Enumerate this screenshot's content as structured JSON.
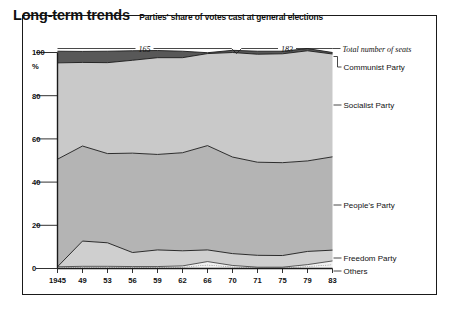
{
  "header": {
    "title": "Long-term trends",
    "subtitle": "Parties' share of votes cast at general elections"
  },
  "colors": {
    "communist": "#585858",
    "socialist": "#c9c9c9",
    "peoples": "#b4b4b4",
    "freedom": "#cfcfcf",
    "others": "#f2f2f2",
    "line": "#1a1a1a",
    "frame": "#1a1a1a"
  },
  "annotations": {
    "seats_left": "165",
    "seats_right": "183",
    "seats_caption": "Total number of seats"
  },
  "legend": {
    "items": [
      {
        "name": "communist",
        "label": "Communist Party"
      },
      {
        "name": "socialist",
        "label": "Socialist Party"
      },
      {
        "name": "peoples",
        "label": "People's Party"
      },
      {
        "name": "freedom",
        "label": "Freedom Party"
      },
      {
        "name": "others",
        "label": "Others"
      }
    ]
  },
  "chart_data": {
    "type": "area",
    "title": "Long-term trends",
    "subtitle": "Parties' share of votes cast at general elections",
    "xlabel": "",
    "ylabel": "%",
    "ylim": [
      0,
      100
    ],
    "yticks": [
      0,
      20,
      40,
      60,
      80,
      100
    ],
    "grid": false,
    "stacked": true,
    "legend_position": "right",
    "x": [
      1945,
      1949,
      1953,
      1956,
      1959,
      1962,
      1966,
      1970,
      1971,
      1975,
      1979,
      1983
    ],
    "categories": [
      "1945",
      "49",
      "53",
      "56",
      "59",
      "62",
      "66",
      "70",
      "71",
      "75",
      "79",
      "83"
    ],
    "series": [
      {
        "name": "Others",
        "values": [
          0.8,
          1.0,
          1.0,
          0.9,
          0.9,
          1.2,
          3.2,
          1.4,
          0.6,
          0.6,
          1.8,
          3.5
        ]
      },
      {
        "name": "Freedom Party",
        "values": [
          0.0,
          11.7,
          10.9,
          6.5,
          7.7,
          7.0,
          5.4,
          5.5,
          5.5,
          5.4,
          6.1,
          5.0
        ]
      },
      {
        "name": "People's Party",
        "values": [
          49.8,
          44.0,
          41.3,
          46.0,
          44.2,
          45.4,
          48.3,
          44.7,
          43.1,
          43.0,
          41.9,
          43.2
        ]
      },
      {
        "name": "Socialist Party",
        "values": [
          44.6,
          38.7,
          42.1,
          43.0,
          44.8,
          44.0,
          42.6,
          48.4,
          50.0,
          50.4,
          51.0,
          47.6
        ]
      },
      {
        "name": "Communist Party",
        "values": [
          5.4,
          5.1,
          5.3,
          4.4,
          3.3,
          3.0,
          0.4,
          1.0,
          1.4,
          1.2,
          1.0,
          0.7
        ]
      }
    ],
    "seat_annotations": [
      {
        "label": "165",
        "from": 1945,
        "to": 1970
      },
      {
        "label": "183",
        "from": 1971,
        "to": 1983
      }
    ]
  }
}
